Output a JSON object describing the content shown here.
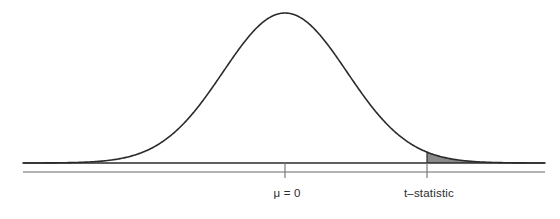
{
  "figure": {
    "type": "statistical-distribution-plot",
    "background_color": "#ffffff",
    "width": 560,
    "height": 219
  },
  "axis": {
    "baseline_color": "#2b2b2b",
    "secondary_line_color": "#9a9a9a",
    "tick_color": "#7a7a7a",
    "x_start": 23,
    "x_end": 545,
    "baseline_y": 163,
    "secondary_y": 172,
    "ticks": [
      {
        "name": "mu-tick",
        "x": 285,
        "label": "μ = 0"
      },
      {
        "name": "t-statistic-tick",
        "x": 427,
        "label": "t–statistic"
      }
    ]
  },
  "curve": {
    "name": "normal-distribution-curve",
    "stroke_color": "#2b2b2b",
    "stroke_width": 1.6,
    "fill": "none",
    "peak_x": 286,
    "peak_y": 13,
    "mean_x": 285,
    "sigma_px": 62
  },
  "shaded_region": {
    "name": "rejection-region-tail",
    "fill_color": "#8a8a8a",
    "stroke_color": "#2b2b2b",
    "start_x": 427,
    "end_x": 545,
    "description": "upper tail area right of the t-statistic"
  },
  "labels": {
    "mu": "μ = 0",
    "t_statistic": "t–statistic"
  },
  "chart_data": {
    "type": "line",
    "title": "",
    "xlabel": "",
    "ylabel": "",
    "grid": false,
    "legend": "none",
    "curve_name": "t-distribution density",
    "mean": 0,
    "tick_values": [
      0
    ],
    "tick_labels": [
      "μ = 0",
      "t–statistic"
    ],
    "annotations": [
      {
        "text": "μ = 0",
        "x_px": 287,
        "y_px": 195
      },
      {
        "text": "t–statistic",
        "x_px": 429,
        "y_px": 195
      }
    ],
    "shaded_tail": {
      "side": "upper",
      "from_label": "t–statistic",
      "to": "+infinity",
      "color": "#8a8a8a"
    },
    "x_px": [
      23,
      40,
      60,
      80,
      100,
      120,
      140,
      160,
      180,
      200,
      220,
      240,
      260,
      285,
      310,
      330,
      350,
      370,
      390,
      410,
      427,
      445,
      465,
      485,
      505,
      525,
      545
    ],
    "y_px": [
      162,
      162,
      161,
      159,
      156,
      150,
      141,
      128,
      111,
      92,
      71,
      51,
      31,
      13,
      31,
      51,
      71,
      92,
      111,
      128,
      142,
      151,
      157,
      160,
      161,
      162,
      162
    ]
  }
}
